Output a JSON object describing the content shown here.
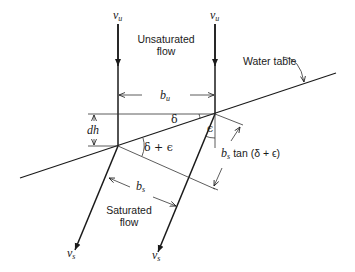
{
  "diagram": {
    "regions": {
      "unsaturated": {
        "line1": "Unsaturated",
        "line2": "flow"
      },
      "saturated": {
        "line1": "Saturated",
        "line2": "flow"
      }
    },
    "water_table_label": "Water table",
    "velocity_labels": {
      "vu_left": {
        "main": "v",
        "sub": "u"
      },
      "vu_right": {
        "main": "v",
        "sub": "u"
      },
      "vs_left": {
        "main": "v",
        "sub": "s"
      },
      "vs_right": {
        "main": "v",
        "sub": "s"
      }
    },
    "dimensions": {
      "bu": {
        "main": "b",
        "sub": "u"
      },
      "bs": {
        "main": "b",
        "sub": "s"
      },
      "dh": "dh",
      "bs_tan": {
        "main": "b",
        "sub": "s",
        "rest": "tan (δ + ϵ)"
      }
    },
    "angles": {
      "delta": "δ",
      "delta_plus_eps": "δ + ϵ",
      "eps": "ϵ"
    },
    "colors": {
      "line": "#1a1a1a",
      "background": "#ffffff"
    }
  }
}
